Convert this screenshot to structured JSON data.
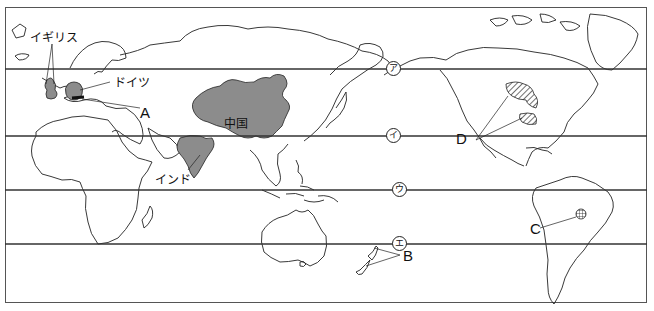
{
  "map": {
    "title_fragment": "略図",
    "latitude_lines": [
      {
        "id": "a",
        "marker": "ア",
        "y": 69
      },
      {
        "id": "i",
        "marker": "イ",
        "y": 136
      },
      {
        "id": "u",
        "marker": "ウ",
        "y": 190
      },
      {
        "id": "e",
        "marker": "エ",
        "y": 244
      }
    ],
    "countries": {
      "uk": "イギリス",
      "germany": "ドイツ",
      "china": "中国",
      "india": "インド"
    },
    "regions": {
      "A": "A",
      "B": "B",
      "C": "C",
      "D": "D"
    },
    "colors": {
      "shaded_country": "#8c8c8c",
      "line": "#333333",
      "coast": "#222222"
    }
  }
}
